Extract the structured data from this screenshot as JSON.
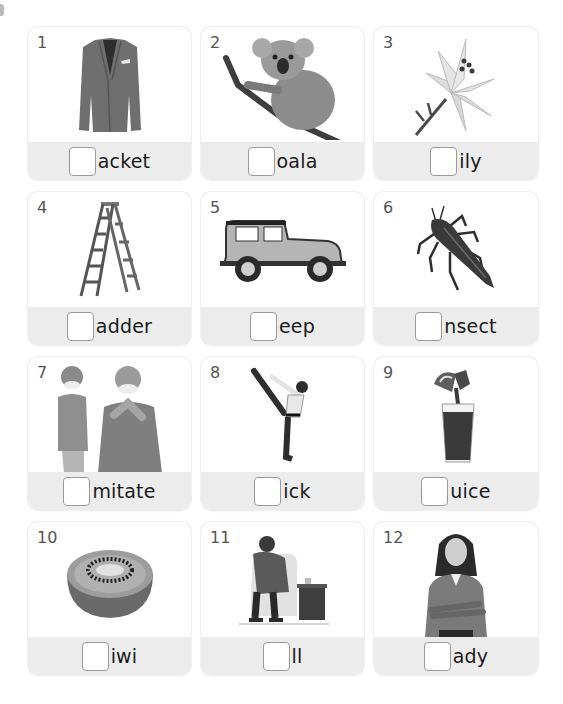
{
  "worksheet": {
    "instruction": "Write the missing first letter of each word",
    "cards": [
      {
        "number": "1",
        "picture": "jacket-picture",
        "word_ending": "acket"
      },
      {
        "number": "2",
        "picture": "koala-picture",
        "word_ending": "oala"
      },
      {
        "number": "3",
        "picture": "lily-picture",
        "word_ending": "ily"
      },
      {
        "number": "4",
        "picture": "ladder-picture",
        "word_ending": "adder"
      },
      {
        "number": "5",
        "picture": "jeep-picture",
        "word_ending": "eep"
      },
      {
        "number": "6",
        "picture": "insect-picture",
        "word_ending": "nsect"
      },
      {
        "number": "7",
        "picture": "imitate-picture",
        "word_ending": "mitate"
      },
      {
        "number": "8",
        "picture": "kick-picture",
        "word_ending": "ick"
      },
      {
        "number": "9",
        "picture": "juice-picture",
        "word_ending": "uice"
      },
      {
        "number": "10",
        "picture": "kiwi-picture",
        "word_ending": "iwi"
      },
      {
        "number": "11",
        "picture": "ill-picture",
        "word_ending": "ll"
      },
      {
        "number": "12",
        "picture": "lady-picture",
        "word_ending": "ady"
      }
    ],
    "colors": {
      "card_band": "#ececec",
      "card_background": "#ffffff",
      "number_text": "#555555",
      "word_text": "#1a1a1a",
      "checkbox_border": "#9a9a9a"
    }
  }
}
